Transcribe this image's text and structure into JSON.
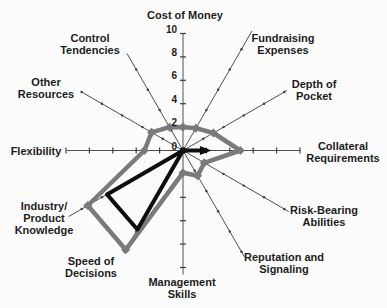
{
  "figure": {
    "background": "#fcfcfc",
    "text_color": "#1c1c1c",
    "spoke_color": "#3c3c3c"
  },
  "chart_data": {
    "type": "radar",
    "title": "",
    "scale": {
      "min": 0,
      "max": 10,
      "tick_step": 2,
      "tick_labels": [
        {
          "text": "10",
          "value": 10
        },
        {
          "text": "8",
          "value": 8
        },
        {
          "text": "6",
          "value": 6
        },
        {
          "text": "4",
          "value": 4
        },
        {
          "text": "2",
          "value": 2
        },
        {
          "text": "0",
          "value": 0
        }
      ],
      "tick_labels_on_axis": "Cost of Money"
    },
    "axes": [
      {
        "label": "Cost of Money",
        "lines": [
          "Cost of Money"
        ],
        "angle_deg": 90,
        "label_px": [
          185,
          15
        ],
        "spoke_px": 117
      },
      {
        "label": "Fundraising Expenses",
        "lines": [
          "Fundraising",
          "Expenses"
        ],
        "angle_deg": 60,
        "label_px": [
          283,
          44
        ],
        "spoke_px": 138
      },
      {
        "label": "Depth of Pocket",
        "lines": [
          "Depth of",
          "Pocket"
        ],
        "angle_deg": 30,
        "label_px": [
          314,
          90
        ],
        "spoke_px": 120
      },
      {
        "label": "Collateral Requirements",
        "lines": [
          "Collateral",
          "Requirements"
        ],
        "angle_deg": 0,
        "label_px": [
          343,
          152
        ],
        "spoke_px": 117
      },
      {
        "label": "Risk-Bearing Abilities",
        "lines": [
          "Risk-Bearing",
          "Abilities"
        ],
        "angle_deg": -30,
        "label_px": [
          324,
          216
        ],
        "spoke_px": 122
      },
      {
        "label": "Reputation and Signaling",
        "lines": [
          "Reputation and",
          "Signaling"
        ],
        "angle_deg": -60,
        "label_px": [
          284,
          263
        ],
        "spoke_px": 123
      },
      {
        "label": "Management Skills",
        "lines": [
          "Management",
          "Skills"
        ],
        "angle_deg": -90,
        "label_px": [
          182,
          288
        ],
        "spoke_px": 124
      },
      {
        "label": "Speed of Decisions",
        "lines": [
          "Speed of",
          "Decisions"
        ],
        "angle_deg": -120,
        "label_px": [
          91,
          267
        ],
        "spoke_px": 118
      },
      {
        "label": "Industry/ Product Knowledge",
        "lines": [
          "Industry/",
          "Product",
          "Knowledge"
        ],
        "angle_deg": -150,
        "label_px": [
          44,
          218
        ],
        "spoke_px": 132
      },
      {
        "label": "Flexibility",
        "lines": [
          "Flexibility"
        ],
        "angle_deg": 180,
        "label_px": [
          36,
          151
        ],
        "spoke_px": 116
      },
      {
        "label": "Other Resources",
        "lines": [
          "Other",
          "Resources"
        ],
        "angle_deg": 150,
        "label_px": [
          46,
          88
        ],
        "spoke_px": 118
      },
      {
        "label": "Control Tendencies",
        "lines": [
          "Control",
          "Tendencies"
        ],
        "angle_deg": 120,
        "label_px": [
          90,
          44
        ],
        "spoke_px": 112
      }
    ],
    "series": [
      {
        "name": "gray-polygon",
        "color": "#7a7a7a",
        "stroke_width": 4.5,
        "marker": "diamond",
        "values": [
          2.0,
          2.2,
          3.0,
          4.9,
          2.1,
          2.5,
          1.9,
          9.8,
          9.4,
          3.3,
          3.1,
          2.3
        ]
      },
      {
        "name": "black-arrow-triangle",
        "color": "#0e0e0e",
        "stroke_width": 4,
        "marker": "none",
        "arrow_on_axis": "Collateral Requirements",
        "center_dot": true,
        "values": [
          0,
          0,
          0,
          2.0,
          0,
          0,
          0,
          7.8,
          7.5,
          0,
          0,
          0
        ]
      }
    ],
    "layout": {
      "center_px": [
        183,
        150.5
      ],
      "px_per_unit": 11.7,
      "legend": "none",
      "grid_rings": "off"
    }
  }
}
